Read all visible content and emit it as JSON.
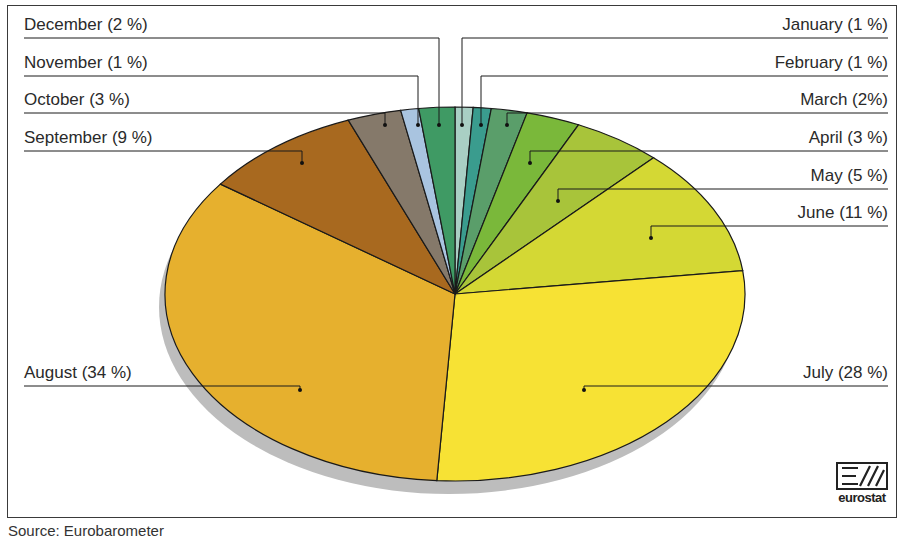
{
  "chart_data": {
    "type": "pie",
    "style": "3d-tilted-ellipse",
    "title": "",
    "start_angle": "12 o'clock",
    "direction": "clockwise",
    "categories": [
      "January",
      "February",
      "March",
      "April",
      "May",
      "June",
      "July",
      "August",
      "September",
      "October",
      "November",
      "December"
    ],
    "values": [
      1,
      1,
      2,
      3,
      5,
      11,
      28,
      34,
      9,
      3,
      1,
      2
    ],
    "unit": "%",
    "labels": [
      "January (1 %)",
      "February (1 %)",
      "March (2%)",
      "April (3 %)",
      "May (5 %)",
      "June (11 %)",
      "July (28 %)",
      "August (34 %)",
      "September (9 %)",
      "October (3 %)",
      "November (1 %)",
      "December (2 %)"
    ],
    "colors": [
      "#a9cfc4",
      "#3a9c8e",
      "#5a9e6a",
      "#7ab83a",
      "#a8c43a",
      "#d4d834",
      "#f7e234",
      "#e6b02e",
      "#a8691f",
      "#85796a",
      "#a9c4e0",
      "#3f9a64"
    ],
    "legend_position": "leader-lines (left and right)",
    "grid": false
  },
  "labels": {
    "left": [
      {
        "text": "December (2 %)",
        "index": 11
      },
      {
        "text": "November (1 %)",
        "index": 10
      },
      {
        "text": "October (3 %)",
        "index": 9
      },
      {
        "text": "September (9 %)",
        "index": 8
      },
      {
        "text": "August (34 %)",
        "index": 7
      }
    ],
    "right": [
      {
        "text": "January (1 %)",
        "index": 0
      },
      {
        "text": "February (1 %)",
        "index": 1
      },
      {
        "text": "March (2%)",
        "index": 2
      },
      {
        "text": "April (3 %)",
        "index": 3
      },
      {
        "text": "May (5 %)",
        "index": 4
      },
      {
        "text": "June (11 %)",
        "index": 5
      },
      {
        "text": "July (28 %)",
        "index": 6
      }
    ]
  },
  "logo": {
    "text": "eurostat"
  },
  "source": {
    "text": "Source: Eurobarometer"
  }
}
